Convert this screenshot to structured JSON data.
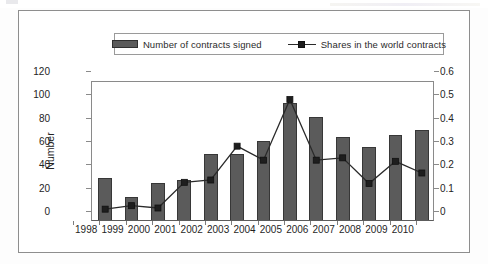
{
  "figure": {
    "legend": {
      "bar_series_label": "Number of contracts signed",
      "line_series_label": "Shares in the world contracts"
    },
    "axes": {
      "y_left_title": "Number",
      "y_left_ticks": [
        "0",
        "20",
        "40",
        "60",
        "80",
        "100",
        "120"
      ],
      "y_right_ticks": [
        "0",
        "0.1",
        "0.2",
        "0.3",
        "0.4",
        "0.5",
        "0.6"
      ]
    },
    "colors": {
      "bar_fill": "#5b5b5b",
      "bar_stroke": "#373737",
      "line_stroke": "#2a2a2a",
      "marker_fill": "#1e1e1e",
      "frame": "#8e8e8e",
      "axis": "#8a8a8a",
      "text": "#242424",
      "background": "#ffffff"
    }
  },
  "chart_data": {
    "type": "bar",
    "title": "",
    "xlabel": "",
    "ylabel": "Number",
    "y2label": "",
    "categories": [
      "1998",
      "1999",
      "2000",
      "2001",
      "2002",
      "2003",
      "2004",
      "2005",
      "2006",
      "2007",
      "2008",
      "2009",
      "2010"
    ],
    "ylim": [
      0,
      120
    ],
    "y2lim": [
      0,
      0.6
    ],
    "yticks": [
      0,
      20,
      40,
      60,
      80,
      100,
      120
    ],
    "y2ticks": [
      0,
      0.1,
      0.2,
      0.3,
      0.4,
      0.5,
      0.6
    ],
    "grid": false,
    "legend_position": "top-center",
    "series": [
      {
        "name": "Number of contracts signed",
        "type": "bar",
        "axis": "left",
        "values": [
          36,
          20,
          32,
          34,
          57,
          57,
          68,
          100,
          88,
          71,
          63,
          73,
          77
        ]
      },
      {
        "name": "Shares in the world contracts",
        "type": "line",
        "axis": "right",
        "marker": "square",
        "values": [
          0.055,
          0.07,
          0.06,
          0.17,
          0.18,
          0.325,
          0.265,
          0.525,
          0.265,
          0.275,
          0.165,
          0.26,
          0.21
        ]
      }
    ]
  }
}
